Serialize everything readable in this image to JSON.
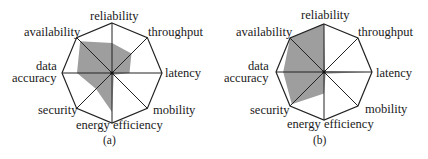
{
  "chart_data": [
    {
      "type": "radar",
      "caption": "(a)",
      "categories": [
        "reliability",
        "throughput",
        "latency",
        "mobility",
        "energy efficiency",
        "security",
        "data accuracy",
        "availability"
      ],
      "values": [
        0.6,
        0.55,
        0.35,
        0.05,
        0.78,
        0.45,
        0.7,
        0.9
      ],
      "range": [
        0,
        1
      ],
      "fill_color": "#9e9e9e"
    },
    {
      "type": "radar",
      "caption": "(b)",
      "categories": [
        "reliability",
        "throughput",
        "latency",
        "mobility",
        "energy efficiency",
        "security",
        "data accuracy",
        "availability"
      ],
      "values": [
        1.0,
        0.03,
        0.9,
        0.05,
        0.45,
        0.95,
        0.85,
        1.0
      ],
      "range": [
        0,
        1
      ],
      "fill_color": "#9e9e9e"
    }
  ],
  "labels": {
    "reliability": "reliability",
    "throughput": "throughput",
    "latency": "latency",
    "mobility": "mobility",
    "energy_efficiency": "energy efficiency",
    "security": "security",
    "data_line1": "data",
    "data_line2": "accuracy",
    "availability": "availability"
  }
}
